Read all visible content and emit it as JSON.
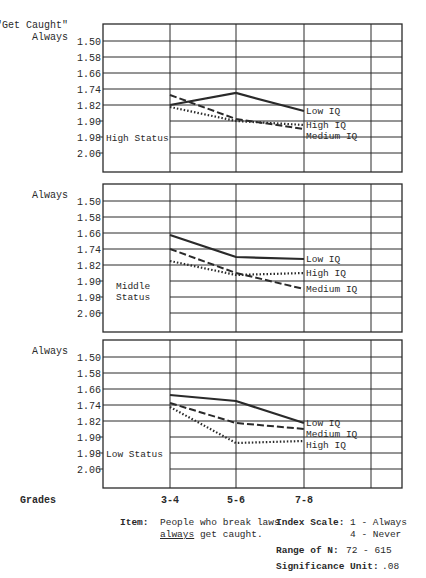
{
  "chart_data": {
    "type": "line",
    "title": "\"Get Caught\"",
    "x": [
      "3-4",
      "5-6",
      "7-8"
    ],
    "xlabel": "Grades",
    "ylabel": "Always",
    "yticks": [
      1.5,
      1.58,
      1.66,
      1.74,
      1.82,
      1.9,
      1.98,
      2.06
    ],
    "ytick_labels": [
      "1.50",
      "1.58",
      "1.66",
      "1.74",
      "1.82",
      "1.90",
      "1.98",
      "2.06"
    ],
    "ylim": [
      1.42,
      2.14
    ],
    "y_inverted": true,
    "grid": true,
    "line_styles": {
      "Low IQ": "solid",
      "Medium IQ": "dashed",
      "High IQ": "dotted"
    },
    "panels": [
      {
        "name": "High Status",
        "label": "High Status",
        "series": [
          {
            "name": "Low IQ",
            "values": [
              1.82,
              1.76,
              1.85
            ]
          },
          {
            "name": "Medium IQ",
            "values": [
              1.77,
              1.89,
              1.94
            ]
          },
          {
            "name": "High IQ",
            "values": [
              1.83,
              1.9,
              1.92
            ]
          }
        ],
        "end_labels": [
          "Low IQ",
          "High IQ",
          "Medium IQ"
        ]
      },
      {
        "name": "Middle Status",
        "label": "Middle\nStatus",
        "series": [
          {
            "name": "Low IQ",
            "values": [
              1.67,
              1.78,
              1.79
            ]
          },
          {
            "name": "Medium IQ",
            "values": [
              1.74,
              1.86,
              1.94
            ]
          },
          {
            "name": "High IQ",
            "values": [
              1.8,
              1.87,
              1.86
            ]
          }
        ],
        "end_labels": [
          "Low IQ",
          "High IQ",
          "Medium IQ"
        ]
      },
      {
        "name": "Low Status",
        "label": "Low Status",
        "series": [
          {
            "name": "Low IQ",
            "values": [
              1.69,
              1.72,
              1.83
            ]
          },
          {
            "name": "Medium IQ",
            "values": [
              1.73,
              1.83,
              1.86
            ]
          },
          {
            "name": "High IQ",
            "values": [
              1.75,
              1.93,
              1.92
            ]
          }
        ],
        "end_labels": [
          "Low IQ",
          "Medium IQ",
          "High IQ"
        ]
      }
    ]
  },
  "footer": {
    "grades_label": "Grades",
    "item_label": "Item:",
    "item_text_line1": "People who break laws",
    "item_text_line2_underlined": "always",
    "item_text_line2_rest": " get caught.",
    "index_scale_label": "Index Scale:",
    "index_scale_1": "1 - Always",
    "index_scale_4": "4 - Never",
    "range_label": "Range of N:",
    "range_value": "72 - 615",
    "significance_label": "Significance Unit:",
    "significance_value": ".08"
  }
}
